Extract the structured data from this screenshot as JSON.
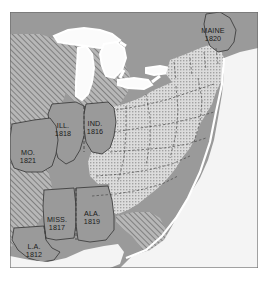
{
  "figure": {
    "kind": "historical-map",
    "region": "eastern-united-states",
    "frame": {
      "x": 10,
      "y": 12,
      "width": 248,
      "height": 256
    }
  },
  "palette": {
    "paper": "#ffffff",
    "land_solid": "#9a9a9a",
    "land_solid_dark": "#8f8f8f",
    "stipple_base": "#d8d8d8",
    "stipple_dot": "#9d9d9d",
    "hatch_base": "#b5b5b5",
    "hatch_line": "#6f6f6f",
    "water": "#fafafa",
    "ocean": "#f2f2f2",
    "border_line": "#3a3a3a",
    "state_border": "#4a4a4a",
    "frame_line": "#6a6a6a",
    "label_text": "#1a1a1a"
  },
  "legend_semantics": {
    "solid_gray": "new states admitted 1812-1821",
    "hatched": "unorganized territory",
    "stippled": "existing states",
    "white": "water"
  },
  "labels": [
    {
      "id": "maine",
      "name": "MAINE",
      "year": "1820",
      "x": 213,
      "y": 27
    },
    {
      "id": "illinois",
      "name": "ILL.",
      "year": "1818",
      "x": 63,
      "y": 122
    },
    {
      "id": "indiana",
      "name": "IND.",
      "year": "1816",
      "x": 95,
      "y": 120
    },
    {
      "id": "missouri",
      "name": "MO.",
      "year": "1821",
      "x": 28,
      "y": 149
    },
    {
      "id": "mississippi",
      "name": "MISS.",
      "year": "1817",
      "x": 57,
      "y": 216
    },
    {
      "id": "alabama",
      "name": "ALA.",
      "year": "1819",
      "x": 92,
      "y": 210
    },
    {
      "id": "louisiana",
      "name": "L.A.",
      "year": "1812",
      "x": 34,
      "y": 243
    }
  ]
}
